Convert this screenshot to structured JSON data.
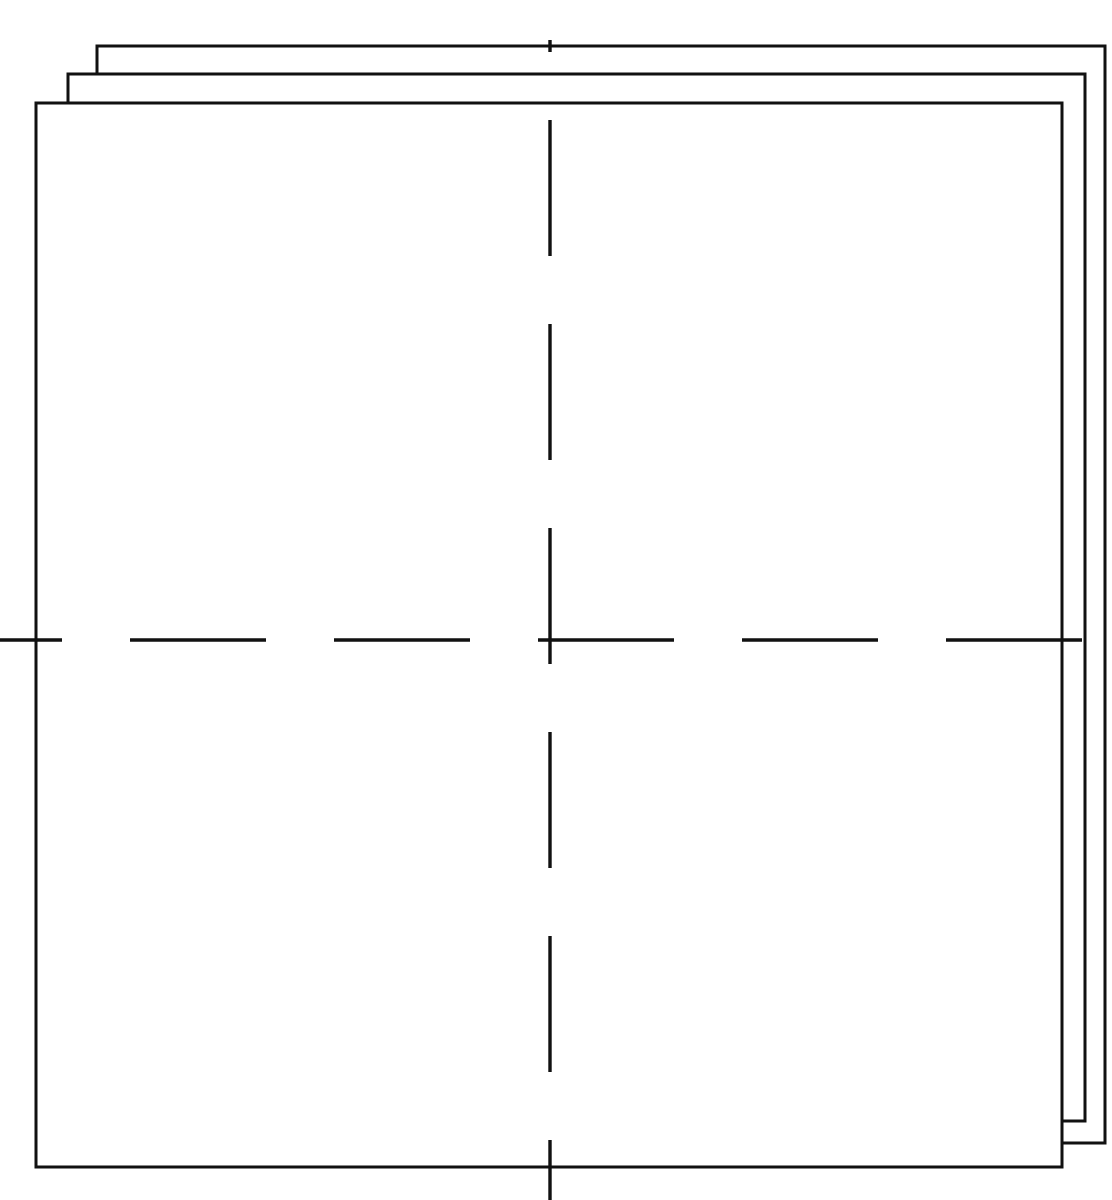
{
  "figure": {
    "background_color": "#ffffff",
    "line_color": "#111111",
    "canvas": {
      "width": 1112,
      "height": 1200
    },
    "sheet_count": 3,
    "sheets": [
      {
        "id": "sheet-back",
        "label": "Back Sheet",
        "z_order": 1,
        "x": 97,
        "y": 46,
        "width": 1008,
        "height": 1097,
        "stroke_width": 3
      },
      {
        "id": "sheet-middle",
        "label": "Middle Sheet",
        "z_order": 2,
        "x": 68,
        "y": 74,
        "width": 1017,
        "height": 1047,
        "stroke_width": 3
      },
      {
        "id": "sheet-front",
        "label": "Front Sheet",
        "z_order": 3,
        "x": 36,
        "y": 103,
        "width": 1026,
        "height": 1064,
        "stroke_width": 3
      }
    ],
    "centerlines": {
      "stroke_width": 3.4,
      "dash_length": 136,
      "gap_length": 68,
      "intersection": {
        "x": 550,
        "y": 640
      },
      "vertical": {
        "id": "centerline-vertical",
        "label": "Vertical Centerline",
        "x": 550,
        "y_start": 40,
        "y_end": 1200
      },
      "horizontal": {
        "id": "centerline-horizontal",
        "label": "Horizontal Centerline",
        "y": 640,
        "x_start": 0,
        "x_end": 1112
      }
    }
  },
  "chart_data": {
    "type": "diagram",
    "xlabel": "",
    "ylabel": "",
    "grid": false,
    "legend": "none",
    "xlim": [
      0,
      1112
    ],
    "ylim": [
      0,
      1200
    ],
    "elements": [
      {
        "name": "sheet-back",
        "shape": "rectangle",
        "x": 97,
        "y": 46,
        "width": 1008,
        "height": 1097
      },
      {
        "name": "sheet-middle",
        "shape": "rectangle",
        "x": 68,
        "y": 74,
        "width": 1017,
        "height": 1047
      },
      {
        "name": "sheet-front",
        "shape": "rectangle",
        "x": 36,
        "y": 103,
        "width": 1026,
        "height": 1064
      },
      {
        "name": "centerline-vertical",
        "shape": "dashed-line",
        "x1": 550,
        "y1": 40,
        "x2": 550,
        "y2": 1200
      },
      {
        "name": "centerline-horizontal",
        "shape": "dashed-line",
        "x1": 0,
        "y1": 640,
        "x2": 1112,
        "y2": 640
      }
    ]
  }
}
